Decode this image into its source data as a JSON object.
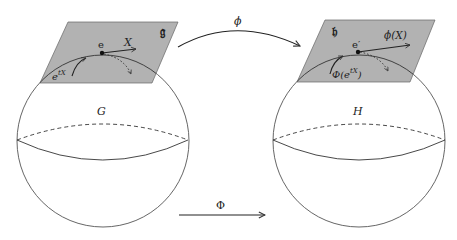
{
  "diagram": {
    "type": "commutative-lie-group-homomorphism",
    "colors": {
      "plane_fill": "#b2b2b2",
      "plane_stroke": "#555555",
      "line": "#333333",
      "background": "#ffffff"
    },
    "left": {
      "group_label": "G",
      "algebra_label": "𝔤",
      "identity_label": "e",
      "vector_label": "X",
      "curve_label": "e",
      "curve_label_sup": "tX"
    },
    "right": {
      "group_label": "H",
      "algebra_label": "𝔥",
      "identity_label": "e′",
      "vector_label": "ϕ(X)",
      "curve_label_prefix": "Φ(e",
      "curve_label_sup": "tX",
      "curve_label_suffix": ")"
    },
    "arrows": {
      "top": {
        "label": "ϕ",
        "from": "𝔤",
        "to": "𝔥"
      },
      "bottom": {
        "label": "Φ",
        "from": "G",
        "to": "H"
      }
    }
  }
}
